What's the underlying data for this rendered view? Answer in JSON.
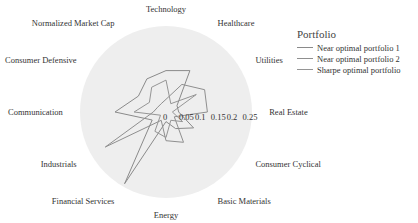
{
  "chart_data": {
    "type": "radar",
    "title": "",
    "axes": [
      "Technology",
      "Healthcare",
      "Utilities",
      "Real Estate",
      "Consumer Cyclical",
      "Basic Materials",
      "Energy",
      "Financial Services",
      "Industrials",
      "Communication",
      "Consumer Defensive",
      "Normalized Market Cap"
    ],
    "radial_ticks": [
      0,
      0.05,
      0.1,
      0.15,
      0.2,
      0.25
    ],
    "radial_range": [
      0,
      0.27
    ],
    "legend_title": "Portfolio",
    "legend_position": "right",
    "series": [
      {
        "name": "Near optimal portfolio 1",
        "color": "#8a8a8a",
        "values": [
          0.13,
          0.15,
          0.04,
          0.04,
          0.1,
          0.06,
          0.03,
          0.26,
          0.05,
          0.16,
          0.1,
          0.12
        ]
      },
      {
        "name": "Near optimal portfolio 2",
        "color": "#8f8f8f",
        "values": [
          0.04,
          0.1,
          0.14,
          0.13,
          0.03,
          0.11,
          0.09,
          0.03,
          0.22,
          0.04,
          0.03,
          0.03
        ]
      },
      {
        "name": "Sharpe optimal portfolio",
        "color": "#959595",
        "values": [
          0.1,
          0.03,
          0.11,
          0.02,
          0.06,
          0.03,
          0.08,
          0.07,
          0.02,
          0.1,
          0.06,
          0.09
        ]
      }
    ]
  },
  "legend": {
    "title": "Portfolio",
    "items": [
      "Near optimal portfolio 1",
      "Near optimal portfolio 2",
      "Sharpe optimal portfolio"
    ]
  },
  "layout": {
    "cx": 166,
    "cy": 112,
    "radius": 86,
    "max_value": 0.27,
    "tick_y": 120,
    "label_radius_factor": 1.2,
    "bg_color": "#eeeeee"
  }
}
